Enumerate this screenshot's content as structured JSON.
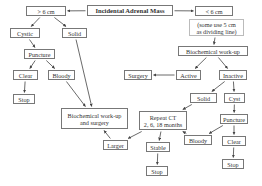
{
  "diagram": {
    "title": "Incidental Adrenal Mass",
    "nodes": {
      "root": {
        "lines": [
          "Incidental Adrenal Mass"
        ]
      },
      "gt6": {
        "lines": [
          "> 6 cm"
        ]
      },
      "lt6": {
        "lines": [
          "< 6 cm"
        ]
      },
      "lt6_note": {
        "lines": [
          "(some use 5 cm",
          "as dividing line)"
        ]
      },
      "cystic": {
        "lines": [
          "Cystic"
        ]
      },
      "solid_left": {
        "lines": [
          "Solid"
        ]
      },
      "puncture_left": {
        "lines": [
          "Puncture"
        ]
      },
      "clear_left": {
        "lines": [
          "Clear"
        ]
      },
      "bloody_left": {
        "lines": [
          "Bloody"
        ]
      },
      "stop_left": {
        "lines": [
          "Stop"
        ]
      },
      "biochem": {
        "lines": [
          "Biochemical work-up"
        ]
      },
      "surgery": {
        "lines": [
          "Surgery"
        ]
      },
      "active": {
        "lines": [
          "Active"
        ]
      },
      "inactive": {
        "lines": [
          "Inactive"
        ]
      },
      "solid_right": {
        "lines": [
          "Solid"
        ]
      },
      "cyst": {
        "lines": [
          "Cyst"
        ]
      },
      "biochem_surgery": {
        "lines": [
          "Biochemical work-up",
          "and surgery"
        ]
      },
      "repeat_ct": {
        "lines": [
          "Repeat CT",
          "2, 6, 18 months"
        ]
      },
      "puncture_right": {
        "lines": [
          "Puncture"
        ]
      },
      "larger": {
        "lines": [
          "Larger"
        ]
      },
      "bloody_right": {
        "lines": [
          "Bloody"
        ]
      },
      "clear_right": {
        "lines": [
          "Clear"
        ]
      },
      "stable": {
        "lines": [
          "Stable"
        ]
      },
      "stop_middle": {
        "lines": [
          "Stop"
        ]
      },
      "stop_right": {
        "lines": [
          "Stop"
        ]
      }
    },
    "edges": [
      {
        "from": "root",
        "to": "gt6"
      },
      {
        "from": "root",
        "to": "lt6"
      },
      {
        "from": "gt6",
        "to": "cystic"
      },
      {
        "from": "gt6",
        "to": "solid_left"
      },
      {
        "from": "cystic",
        "to": "puncture_left"
      },
      {
        "from": "puncture_left",
        "to": "clear_left"
      },
      {
        "from": "puncture_left",
        "to": "bloody_left"
      },
      {
        "from": "clear_left",
        "to": "stop_left"
      },
      {
        "from": "bloody_left",
        "to": "biochem_surgery"
      },
      {
        "from": "solid_left",
        "to": "biochem_surgery"
      },
      {
        "from": "lt6_note",
        "to": "biochem"
      },
      {
        "from": "biochem",
        "to": "active"
      },
      {
        "from": "biochem",
        "to": "inactive"
      },
      {
        "from": "active",
        "to": "surgery"
      },
      {
        "from": "inactive",
        "to": "solid_right"
      },
      {
        "from": "inactive",
        "to": "cyst"
      },
      {
        "from": "solid_right",
        "to": "repeat_ct"
      },
      {
        "from": "cyst",
        "to": "puncture_right"
      },
      {
        "from": "puncture_right",
        "to": "bloody_right"
      },
      {
        "from": "puncture_right",
        "to": "clear_right"
      },
      {
        "from": "bloody_right",
        "to": "repeat_ct"
      },
      {
        "from": "clear_right",
        "to": "stop_right"
      },
      {
        "from": "repeat_ct",
        "to": "larger"
      },
      {
        "from": "repeat_ct",
        "to": "stable"
      },
      {
        "from": "larger",
        "to": "biochem_surgery"
      },
      {
        "from": "stable",
        "to": "stop_middle"
      }
    ]
  }
}
